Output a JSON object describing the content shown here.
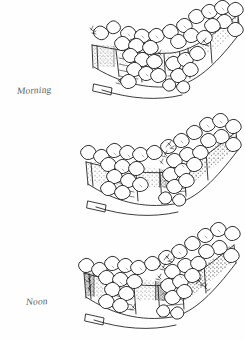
{
  "page": {
    "background_color": "#fefefe",
    "ink_color": "#1a1a1a",
    "medium": "pen-and-ink line drawing with stipple shading",
    "width": 245,
    "height": 340
  },
  "panels": [
    {
      "id": "morning",
      "label": "Morning",
      "label_style": "handwritten cursive",
      "shadow_side": "left",
      "shadow_intensity": "light",
      "stipple_density": "low",
      "foliage_cluster_count": 34,
      "icon": "garden-wall-sketch-icon"
    },
    {
      "id": "noon",
      "label": "Noon",
      "label_style": "handwritten cursive",
      "shadow_side": "center",
      "shadow_intensity": "medium",
      "stipple_density": "medium",
      "foliage_cluster_count": 32,
      "icon": "garden-wall-sketch-icon"
    },
    {
      "id": "evening",
      "label": "Evening",
      "label_style": "handwritten cursive",
      "shadow_side": "right",
      "shadow_intensity": "heavy",
      "stipple_density": "high",
      "foliage_cluster_count": 33,
      "icon": "garden-wall-sketch-icon"
    }
  ]
}
